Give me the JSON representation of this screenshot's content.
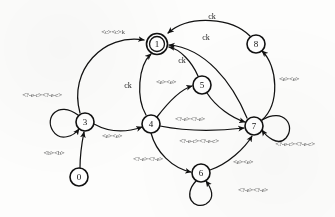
{
  "diagram": {
    "type": "finite-state-automaton",
    "width": 335,
    "height": 217,
    "ink_color": "#111111",
    "background_color": "#fdfdfc"
  },
  "nodes": [
    {
      "id": "0",
      "label": "0",
      "cx": 79,
      "cy": 177,
      "r": 9,
      "accepting": false
    },
    {
      "id": "1",
      "label": "1",
      "cx": 157,
      "cy": 44,
      "r": 10,
      "accepting": true
    },
    {
      "id": "3",
      "label": "3",
      "cx": 85,
      "cy": 122,
      "r": 9,
      "accepting": false
    },
    {
      "id": "4",
      "label": "4",
      "cx": 151,
      "cy": 124,
      "r": 9,
      "accepting": false
    },
    {
      "id": "5",
      "label": "5",
      "cx": 202,
      "cy": 85,
      "r": 9,
      "accepting": false
    },
    {
      "id": "6",
      "label": "6",
      "cx": 201,
      "cy": 173,
      "r": 9,
      "accepting": false
    },
    {
      "id": "7",
      "label": "7",
      "cx": 254,
      "cy": 126,
      "r": 9,
      "accepting": false
    },
    {
      "id": "8",
      "label": "8",
      "cx": 256,
      "cy": 44,
      "r": 9,
      "accepting": false
    }
  ],
  "edges": [
    {
      "id": "e-3-1",
      "from": "3",
      "to": "1",
      "label": "<c><c>k",
      "label_x": 113,
      "label_y": 32
    },
    {
      "id": "e-8-1",
      "from": "8",
      "to": "1",
      "label": "ck",
      "label_x": 212,
      "label_y": 16
    },
    {
      "id": "e-7-1",
      "from": "7",
      "to": "1",
      "label": "ck",
      "label_x": 206,
      "label_y": 37
    },
    {
      "id": "e-5-1",
      "from": "5",
      "to": "1",
      "label": "ck",
      "label_x": 182,
      "label_y": 60
    },
    {
      "id": "e-4-1",
      "from": "4",
      "to": "1",
      "label": "ck",
      "label_x": 128,
      "label_y": 85
    },
    {
      "id": "e-4-5",
      "from": "4",
      "to": "5",
      "label": "<e><e>",
      "label_x": 166,
      "label_y": 82
    },
    {
      "id": "e-0-3",
      "from": "0",
      "to": "3",
      "label": "<b><b>",
      "label_x": 54,
      "label_y": 153
    },
    {
      "id": "e-3-4",
      "from": "3",
      "to": "4",
      "label": "<e><e>",
      "label_x": 112,
      "label_y": 136
    },
    {
      "id": "e-3-3",
      "from": "3",
      "to": "3",
      "label": "<?-e-c><?-e-c>",
      "label_x": 42,
      "label_y": 95
    },
    {
      "id": "e-5-7",
      "from": "5",
      "to": "7",
      "label": "<?-e><?-e>",
      "label_x": 190,
      "label_y": 119
    },
    {
      "id": "e-4-7",
      "from": "4",
      "to": "7",
      "label": "<?-e-c><?-e-c>",
      "label_x": 199,
      "label_y": 141
    },
    {
      "id": "e-4-6",
      "from": "4",
      "to": "6",
      "label": "<?-e><?-e>",
      "label_x": 148,
      "label_y": 159
    },
    {
      "id": "e-6-7",
      "from": "6",
      "to": "7",
      "label": "<e><e>",
      "label_x": 243,
      "label_y": 162
    },
    {
      "id": "e-7-8",
      "from": "7",
      "to": "8",
      "label": "<e><e>",
      "label_x": 289,
      "label_y": 79
    },
    {
      "id": "e-7-7",
      "from": "7",
      "to": "7",
      "label": "<?-e-c><?-e-c>",
      "label_x": 295,
      "label_y": 144
    },
    {
      "id": "e-6-6",
      "from": "6",
      "to": "6",
      "label": "<?-e><?-e>",
      "label_x": 253,
      "label_y": 190
    }
  ]
}
